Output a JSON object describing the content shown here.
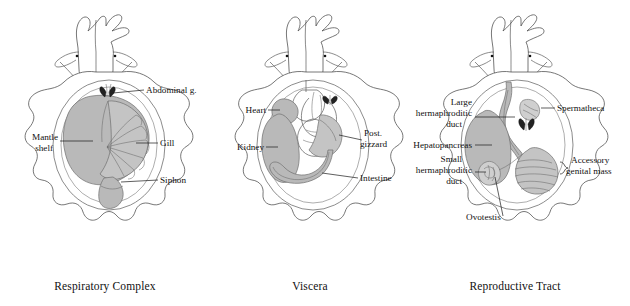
{
  "figure": {
    "background": "#ffffff",
    "organ_fill": "#b9b9b9",
    "outline_color": "#4a4a4a",
    "label_color": "#111111"
  },
  "panels": [
    {
      "id": "respiratory",
      "caption": "Respiratory Complex",
      "labels": [
        {
          "name": "abdominal-gland",
          "lines": [
            "Abdominal g."
          ],
          "side": "right"
        },
        {
          "name": "mantle-shelf",
          "lines": [
            "Mantle",
            "shelf"
          ],
          "side": "left"
        },
        {
          "name": "gill",
          "lines": [
            "Gill"
          ],
          "side": "right"
        },
        {
          "name": "siphon",
          "lines": [
            "Siphon"
          ],
          "side": "right"
        }
      ]
    },
    {
      "id": "viscera",
      "caption": "Viscera",
      "labels": [
        {
          "name": "heart",
          "lines": [
            "Heart"
          ],
          "side": "left"
        },
        {
          "name": "kidney",
          "lines": [
            "Kidney"
          ],
          "side": "left"
        },
        {
          "name": "post-gizzard",
          "lines": [
            "Post.",
            "gizzard"
          ],
          "side": "right"
        },
        {
          "name": "intestine",
          "lines": [
            "Intestine"
          ],
          "side": "right"
        }
      ]
    },
    {
      "id": "reproductive",
      "caption": "Reproductive Tract",
      "labels": [
        {
          "name": "large-hermaphroditic-duct",
          "lines": [
            "Large",
            "hermaphroditic",
            "duct"
          ],
          "side": "left"
        },
        {
          "name": "hepatopancreas",
          "lines": [
            "Hepatopancreas"
          ],
          "side": "left"
        },
        {
          "name": "small-hermaphroditic-duct",
          "lines": [
            "Small",
            "hermaphroditic",
            "duct"
          ],
          "side": "left"
        },
        {
          "name": "ovotestis",
          "lines": [
            "Ovotestis"
          ],
          "side": "bottom"
        },
        {
          "name": "spermatheca",
          "lines": [
            "Spermatheca"
          ],
          "side": "right"
        },
        {
          "name": "accessory-genital-mass",
          "lines": [
            "Accessory",
            "genital mass"
          ],
          "side": "right"
        }
      ]
    }
  ]
}
